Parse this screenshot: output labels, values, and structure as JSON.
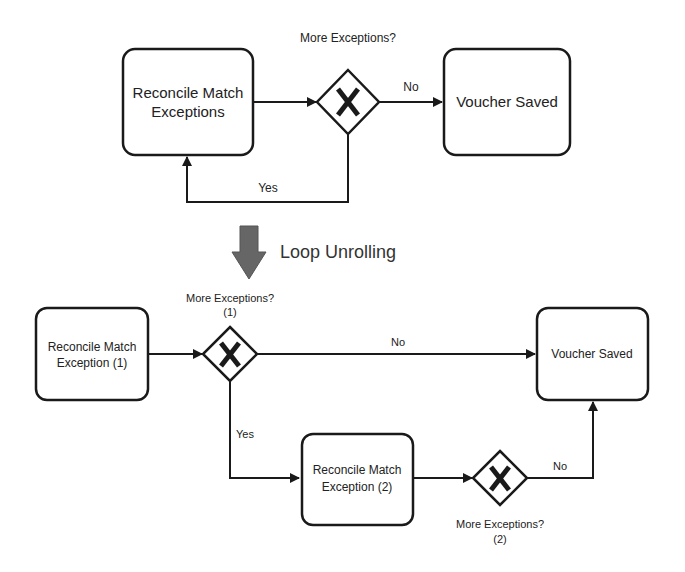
{
  "top_diagram": {
    "task": {
      "line1": "Reconcile Match",
      "line2": "Exceptions"
    },
    "gateway": {
      "label": "More Exceptions?",
      "symbol": "X"
    },
    "end": {
      "label": "Voucher Saved"
    },
    "edges": {
      "no": "No",
      "yes": "Yes"
    }
  },
  "transform": {
    "label": "Loop Unrolling",
    "arrow_color": "#666666"
  },
  "bottom_diagram": {
    "task1": {
      "line1": "Reconcile Match",
      "line2": "Exception (1)"
    },
    "gateway1": {
      "line1": "More Exceptions?",
      "line2": "(1)",
      "symbol": "X"
    },
    "end": {
      "label": "Voucher Saved"
    },
    "task2": {
      "line1": "Reconcile Match",
      "line2": "Exception (2)"
    },
    "gateway2": {
      "line1": "More Exceptions?",
      "line2": "(2)",
      "symbol": "X"
    },
    "edges": {
      "no1": "No",
      "yes1": "Yes",
      "no2": "No"
    }
  }
}
